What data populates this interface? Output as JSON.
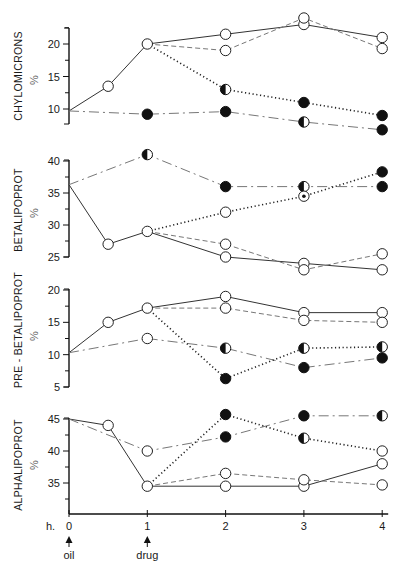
{
  "chart_data": {
    "type": "line",
    "x_ticks": [
      0,
      1,
      2,
      3,
      4
    ],
    "x_unit_label": "h.",
    "annotations": [
      {
        "x": 0,
        "label": "oil",
        "marker": "up-arrow"
      },
      {
        "x": 1,
        "label": "drug",
        "marker": "up-arrow"
      }
    ],
    "axis_unit": "%",
    "panels": [
      {
        "ylabel": "CHYLOMICRONS",
        "ylim": [
          8,
          22.5
        ],
        "yticks": [
          10,
          15,
          20
        ],
        "series": [
          {
            "name": "control-solid",
            "style": "solid",
            "x": [
              0,
              0.5,
              1,
              2,
              3,
              4
            ],
            "y": [
              9.7,
              13.5,
              20,
              21.5,
              23,
              21
            ],
            "markers": [
              "none",
              "open",
              "open",
              "open",
              "open",
              "open"
            ]
          },
          {
            "name": "dashed",
            "style": "dashed",
            "x": [
              1,
              2,
              3,
              4
            ],
            "y": [
              20,
              19,
              24,
              19.3
            ],
            "markers": [
              "none",
              "open",
              "open",
              "open"
            ]
          },
          {
            "name": "dotted",
            "style": "dotted",
            "x": [
              1,
              2,
              3,
              4
            ],
            "y": [
              20,
              13,
              11,
              9
            ],
            "markers": [
              "none",
              "half",
              "filled",
              "filled"
            ]
          },
          {
            "name": "dash-dot",
            "style": "dashdot",
            "x": [
              0,
              1,
              2,
              3,
              4
            ],
            "y": [
              9.7,
              9.2,
              9.6,
              8,
              6.8
            ],
            "markers": [
              "none",
              "filled",
              "filled",
              "half",
              "filled"
            ]
          }
        ]
      },
      {
        "ylabel": "BETALIPOPROT",
        "ylim": [
          25,
          40.2
        ],
        "yticks": [
          25,
          30,
          35,
          40
        ],
        "series": [
          {
            "name": "dash-dot",
            "style": "dashdot",
            "x": [
              0,
              1,
              2,
              3,
              4
            ],
            "y": [
              36.3,
              41,
              36,
              36,
              36
            ],
            "markers": [
              "none",
              "half",
              "filled",
              "half",
              "filled"
            ]
          },
          {
            "name": "control-solid",
            "style": "solid",
            "x": [
              0,
              0.5,
              1,
              2,
              3,
              4
            ],
            "y": [
              36.3,
              27,
              29,
              25,
              24,
              23
            ],
            "markers": [
              "none",
              "open",
              "open",
              "open",
              "open",
              "open"
            ]
          },
          {
            "name": "dashed",
            "style": "dashed",
            "x": [
              1,
              2,
              3,
              4
            ],
            "y": [
              29,
              27,
              23,
              25.5
            ],
            "markers": [
              "none",
              "open",
              "open",
              "open"
            ]
          },
          {
            "name": "dotted",
            "style": "dotted",
            "x": [
              1,
              2,
              3,
              4
            ],
            "y": [
              29,
              32,
              34.5,
              38.3
            ],
            "markers": [
              "none",
              "open",
              "dot",
              "filled"
            ]
          }
        ]
      },
      {
        "ylabel": "PRE - BETALIPOPROT",
        "ylim": [
          5,
          20.2
        ],
        "yticks": [
          5,
          10,
          15,
          20
        ],
        "series": [
          {
            "name": "control-solid",
            "style": "solid",
            "x": [
              0,
              0.5,
              1,
              2,
              3,
              4
            ],
            "y": [
              10.3,
              15,
              17.2,
              19,
              16.5,
              16.5
            ],
            "markers": [
              "none",
              "open",
              "open",
              "open",
              "open",
              "open"
            ]
          },
          {
            "name": "dashed",
            "style": "dashed",
            "x": [
              1,
              2,
              3,
              4
            ],
            "y": [
              17.2,
              17.2,
              15.3,
              15
            ],
            "markers": [
              "none",
              "open",
              "open",
              "open"
            ]
          },
          {
            "name": "dash-dot",
            "style": "dashdot",
            "x": [
              0,
              1,
              2,
              3,
              4
            ],
            "y": [
              10.3,
              12.5,
              11,
              8,
              9.5
            ],
            "markers": [
              "none",
              "open",
              "half",
              "filled",
              "filled"
            ]
          },
          {
            "name": "dotted",
            "style": "dotted",
            "x": [
              1,
              2,
              3,
              4
            ],
            "y": [
              17.2,
              6.3,
              11,
              11.2
            ],
            "markers": [
              "none",
              "filled",
              "half",
              "half"
            ]
          }
        ]
      },
      {
        "ylabel": "ALPHALIPOPROT",
        "ylim": [
          30.2,
          45.3
        ],
        "yticks": [
          35,
          40,
          45
        ],
        "series": [
          {
            "name": "control-solid",
            "style": "solid",
            "x": [
              0,
              0.5,
              1,
              2,
              3,
              4
            ],
            "y": [
              45,
              44,
              34.5,
              34.5,
              34.5,
              38
            ],
            "markers": [
              "none",
              "open",
              "open",
              "open",
              "open",
              "open"
            ]
          },
          {
            "name": "dash-dot",
            "style": "dashdot",
            "x": [
              0,
              1,
              2,
              3,
              4
            ],
            "y": [
              45,
              40,
              42.2,
              45.5,
              45.5
            ],
            "markers": [
              "none",
              "open",
              "filled",
              "filled",
              "half"
            ]
          },
          {
            "name": "dashed",
            "style": "dashed",
            "x": [
              1,
              2,
              3,
              4
            ],
            "y": [
              34.5,
              36.5,
              35.5,
              34.7
            ],
            "markers": [
              "none",
              "open",
              "open",
              "open"
            ]
          },
          {
            "name": "dotted",
            "style": "dotted",
            "x": [
              1,
              2,
              3,
              4
            ],
            "y": [
              34.5,
              45.7,
              42,
              40
            ],
            "markers": [
              "none",
              "filled",
              "half",
              "open"
            ]
          }
        ]
      }
    ]
  }
}
